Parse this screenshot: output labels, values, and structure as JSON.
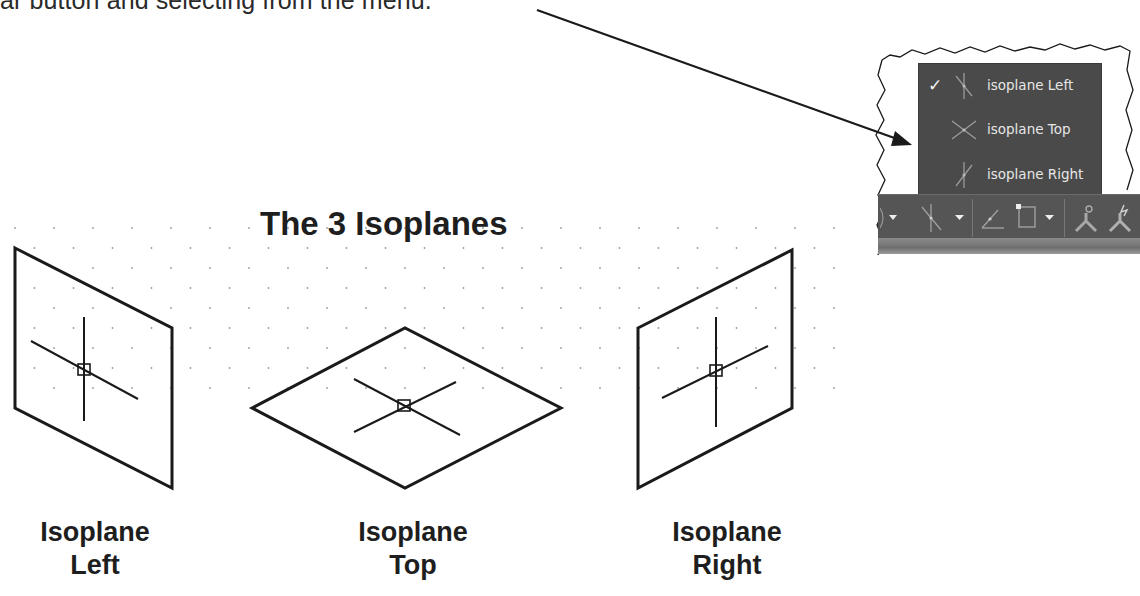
{
  "intro_text": "ar button and selecting from the menu.",
  "figure": {
    "title": "The 3 Isoplanes",
    "planes": [
      {
        "line1": "Isoplane",
        "line2": "Left"
      },
      {
        "line1": "Isoplane",
        "line2": "Top"
      },
      {
        "line1": "Isoplane",
        "line2": "Right"
      }
    ]
  },
  "menu": {
    "items": [
      {
        "label": "isoplane Left",
        "checked": true,
        "check_glyph": "✓",
        "icon": "isoplane-left-icon"
      },
      {
        "label": "isoplane Top",
        "checked": false,
        "check_glyph": "",
        "icon": "isoplane-top-icon"
      },
      {
        "label": "isoplane Right",
        "checked": false,
        "check_glyph": "",
        "icon": "isoplane-right-icon"
      }
    ]
  },
  "toolbar": {
    "buttons": [
      "dropdown-arrow",
      "isoplane-toggle",
      "dropdown-arrow",
      "polar-tracking",
      "object-snap",
      "dropdown-arrow",
      "annotation-visibility",
      "auto-scale"
    ]
  },
  "colors": {
    "line": "#1a1a1a",
    "menu_bg": "#4a4a4a",
    "menu_text": "#e6e6e6",
    "toolbar_bg": "#555555"
  }
}
